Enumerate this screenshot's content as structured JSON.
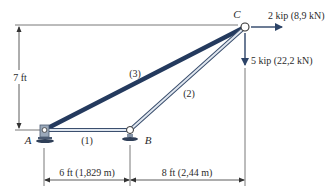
{
  "diagram": {
    "type": "truss",
    "nodes": [
      {
        "id": "A",
        "label": "A",
        "support": "pin"
      },
      {
        "id": "B",
        "label": "B",
        "support": "pin"
      },
      {
        "id": "C",
        "label": "C",
        "support": "none"
      }
    ],
    "members": [
      {
        "id": "1",
        "label": "(1)",
        "from": "A",
        "to": "B"
      },
      {
        "id": "2",
        "label": "(2)",
        "from": "B",
        "to": "C"
      },
      {
        "id": "3",
        "label": "(3)",
        "from": "A",
        "to": "C"
      }
    ],
    "loads": [
      {
        "node": "C",
        "direction": "right",
        "label": "2 kip (8,9 kN)"
      },
      {
        "node": "C",
        "direction": "down",
        "label": "5 kip (22,2 kN)"
      }
    ],
    "dimensions": {
      "height": "7 ft",
      "ab_span": "6 ft (1,829 m)",
      "bc_span": "8 ft (2,44 m)"
    },
    "colors": {
      "member_dark": "#243a5e",
      "member_light": "#b8c4d4",
      "line": "#333333",
      "arrow": "#2d4468"
    }
  }
}
